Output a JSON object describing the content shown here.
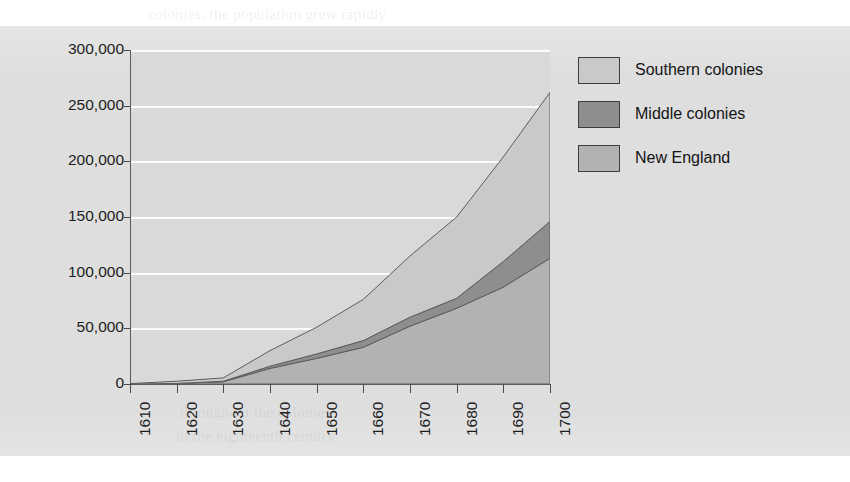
{
  "figure": {
    "background_color": "#ffffff",
    "panel_color": "#dedede",
    "plot_background_color": "#d9d9d9",
    "gridline_color": "#fbfbfb",
    "axis_color": "#5a5a5a"
  },
  "bleed_text": [
    {
      "text": "colonies, the population grew rapidly",
      "x": 148,
      "y": 6
    },
    {
      "text": "settlers could not produce enough",
      "x": 160,
      "y": 56
    },
    {
      "text": "the slave labor force gradually",
      "x": 178,
      "y": 80
    },
    {
      "text": "after 1680 in the southern",
      "x": 196,
      "y": 103
    },
    {
      "text": "planters turned to Africa",
      "x": 186,
      "y": 126
    },
    {
      "text": "for a steady supply of",
      "x": 202,
      "y": 150
    },
    {
      "text": "workers. Between 1680",
      "x": 182,
      "y": 176
    },
    {
      "text": "and 1700 the number",
      "x": 190,
      "y": 200
    },
    {
      "text": "of enslaved Africans",
      "x": 176,
      "y": 224
    },
    {
      "text": "in the Chesapeake",
      "x": 192,
      "y": 248
    },
    {
      "text": "region increased",
      "x": 186,
      "y": 272
    },
    {
      "text": "dramatically as",
      "x": 198,
      "y": 296
    },
    {
      "text": "tobacco planters",
      "x": 180,
      "y": 320
    },
    {
      "text": "expanded their",
      "x": 194,
      "y": 344
    },
    {
      "text": "landholdings",
      "x": 200,
      "y": 368
    },
    {
      "text": "throughout the colonies",
      "x": 180,
      "y": 404
    },
    {
      "text": "in the eighteenth century",
      "x": 176,
      "y": 428
    }
  ],
  "legend": {
    "position": "right",
    "items": [
      {
        "label": "Southern colonies",
        "color": "#c9c9c9",
        "swatch_name": "legend-swatch-southern"
      },
      {
        "label": "Middle colonies",
        "color": "#8e8e8e",
        "swatch_name": "legend-swatch-middle"
      },
      {
        "label": "New England",
        "color": "#b2b2b2",
        "swatch_name": "legend-swatch-new-england"
      }
    ]
  },
  "chart_data": {
    "type": "area",
    "stacked": true,
    "title": "",
    "subtitle": "",
    "xlabel": "",
    "ylabel": "",
    "xlim": [
      1610,
      1700
    ],
    "ylim": [
      0,
      300000
    ],
    "grid": true,
    "legend_position": "right",
    "x": [
      1610,
      1620,
      1630,
      1640,
      1650,
      1660,
      1670,
      1680,
      1690,
      1700
    ],
    "xtick_labels": [
      "1610",
      "1620",
      "1630",
      "1640",
      "1650",
      "1660",
      "1670",
      "1680",
      "1690",
      "1700"
    ],
    "ytick_labels": [
      "0",
      "50,000",
      "100,000",
      "150,000",
      "200,000",
      "250,000",
      "300,000"
    ],
    "ytick_values": [
      0,
      50000,
      100000,
      150000,
      200000,
      250000,
      300000
    ],
    "series": [
      {
        "name": "New England",
        "color": "#b2b2b2",
        "stack_order": 1,
        "values": [
          0,
          500,
          2000,
          14000,
          23000,
          33000,
          52000,
          68000,
          87000,
          113000
        ]
      },
      {
        "name": "Middle colonies",
        "color": "#8e8e8e",
        "stack_order": 2,
        "values": [
          0,
          0,
          500,
          2000,
          4000,
          6000,
          8000,
          9000,
          23000,
          33000
        ]
      },
      {
        "name": "Southern colonies",
        "color": "#c9c9c9",
        "stack_order": 3,
        "values": [
          350,
          2000,
          3000,
          14000,
          24000,
          37000,
          55000,
          73000,
          94000,
          116000
        ]
      }
    ],
    "totals": [
      350,
      2500,
      5500,
      30000,
      51000,
      76000,
      115000,
      150000,
      204000,
      262000
    ]
  }
}
